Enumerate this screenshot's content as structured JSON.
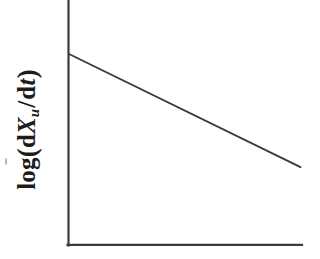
{
  "figure": {
    "background_color": "#ffffff",
    "ink_color": "#3a3a3a",
    "text_color": "#1c1c1c",
    "axis_label_y": "log( dXu / dt )",
    "axis_label_y_parts": {
      "function": "log",
      "open_paren": "(",
      "d_upright_1": "d",
      "variable": "X",
      "subscript": "u",
      "slash": "/",
      "d_upright_2": "d",
      "time_variable": "t",
      "close_paren": ")"
    },
    "axis_label_x": ""
  },
  "chart_data": {
    "type": "line",
    "title": "",
    "xlabel": "",
    "ylabel": "log( dXu / dt )",
    "grid": false,
    "legend": false,
    "axes_style": "L-shaped spine, no tick marks, no tick labels",
    "xlim": [
      0,
      1
    ],
    "ylim": [
      0,
      1
    ],
    "series": [
      {
        "name": "decay trend",
        "style": "straight descending line",
        "x": [
          0.0,
          1.0
        ],
        "y": [
          1.0,
          0.23
        ],
        "slope": -0.77
      }
    ],
    "annotations": []
  }
}
